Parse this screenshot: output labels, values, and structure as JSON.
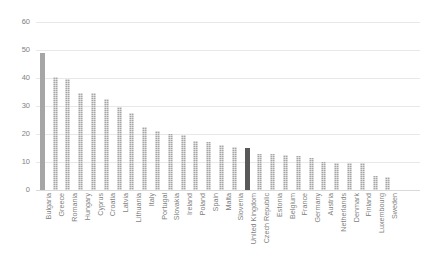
{
  "chart_data": {
    "type": "bar",
    "title": "",
    "subtitle": "",
    "xlabel": "",
    "ylabel": "",
    "ylim": [
      0,
      60
    ],
    "yticks": [
      0,
      10,
      20,
      30,
      40,
      50,
      60
    ],
    "grid": true,
    "legend": "none",
    "orientation": "vertical",
    "highlight_category": "United Kingdom",
    "highlight_color": "#595959",
    "bar_color": "#a6a6a6",
    "gridline_color": "#e8e8e8",
    "tick_label_color": "#7f7f7f",
    "categories": [
      "Bulgaria",
      "Greece",
      "Romania",
      "Hungary",
      "Cyprus",
      "Croatia",
      "Latvia",
      "Lithuania",
      "Italy",
      "Portugal",
      "Slovakia",
      "Ireland",
      "Poland",
      "Spain",
      "Malta",
      "Slovenia",
      "United Kingdom",
      "Czech Republic",
      "Estonia",
      "Belgium",
      "France",
      "Germany",
      "Austria",
      "Netherlands",
      "Denmark",
      "Finland",
      "Luxembourg",
      "Sweden"
    ],
    "values": [
      49,
      40.5,
      39.5,
      34.5,
      34.5,
      32.5,
      29.5,
      27.5,
      22.5,
      21,
      20,
      19.5,
      17.5,
      17,
      16,
      15.5,
      15,
      13,
      13,
      12.5,
      12,
      11.5,
      10,
      9.5,
      9.5,
      9.5,
      5,
      4.5
    ]
  }
}
